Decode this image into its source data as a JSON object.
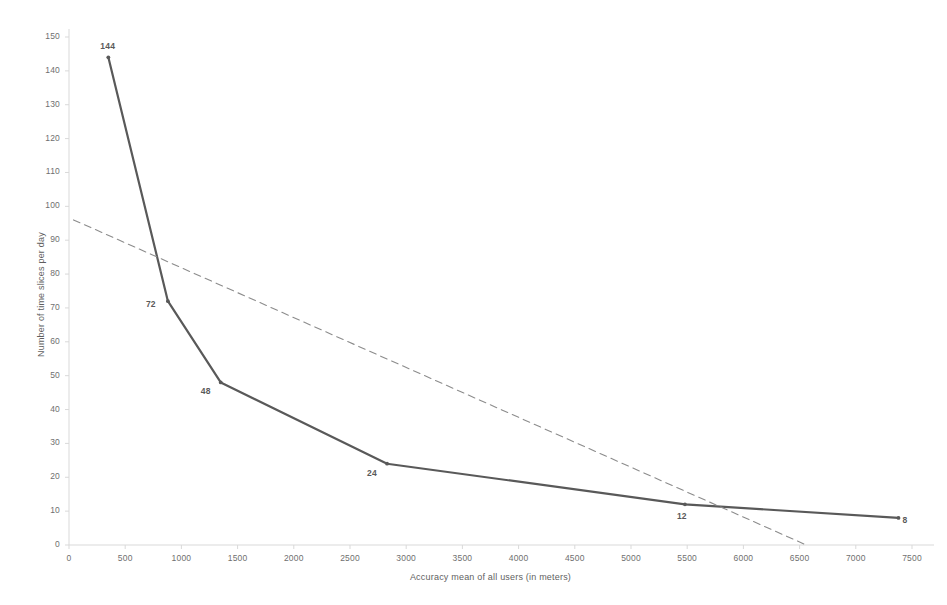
{
  "chart_data": {
    "type": "line",
    "title": "",
    "xlabel": "Accuracy mean of all users (in meters)",
    "ylabel": "Number of time slices per day",
    "xlim": [
      0,
      7500
    ],
    "ylim": [
      0,
      150
    ],
    "xticks": [
      0,
      500,
      1000,
      1500,
      2000,
      2500,
      3000,
      3500,
      4000,
      4500,
      5000,
      5500,
      6000,
      6500,
      7000,
      7500
    ],
    "yticks": [
      0,
      10,
      20,
      30,
      40,
      50,
      60,
      70,
      80,
      90,
      100,
      110,
      120,
      130,
      140,
      150
    ],
    "grid": false,
    "legend": "none",
    "series": [
      {
        "name": "time slices vs accuracy",
        "style": "solid",
        "color": "#595959",
        "markers": true,
        "points": [
          {
            "x": 350,
            "y": 144,
            "label": "144",
            "label_pos": "above"
          },
          {
            "x": 880,
            "y": 72,
            "label": "72",
            "label_pos": "left"
          },
          {
            "x": 1350,
            "y": 48,
            "label": "48",
            "label_pos": "below-left"
          },
          {
            "x": 2830,
            "y": 24,
            "label": "24",
            "label_pos": "below-left"
          },
          {
            "x": 5480,
            "y": 12,
            "label": "12",
            "label_pos": "below"
          },
          {
            "x": 7380,
            "y": 8,
            "label": "8",
            "label_pos": "right"
          }
        ]
      },
      {
        "name": "linear trendline",
        "style": "dashed",
        "color": "#8c8c8c",
        "markers": false,
        "points": [
          {
            "x": 40,
            "y": 96
          },
          {
            "x": 6560,
            "y": 0
          }
        ]
      }
    ]
  },
  "axes": {
    "x_title": "Accuracy mean of all users (in meters)",
    "y_title": "Number of time slices per day",
    "x_tick_labels": [
      "0",
      "500",
      "1000",
      "1500",
      "2000",
      "2500",
      "3000",
      "3500",
      "4000",
      "4500",
      "5000",
      "5500",
      "6000",
      "6500",
      "7000",
      "7500"
    ],
    "y_tick_labels": [
      "0",
      "10",
      "20",
      "30",
      "40",
      "50",
      "60",
      "70",
      "80",
      "90",
      "100",
      "110",
      "120",
      "130",
      "140",
      "150"
    ],
    "axis_color": "#d9d9d9"
  },
  "point_labels": [
    "144",
    "72",
    "48",
    "24",
    "12",
    "8"
  ]
}
